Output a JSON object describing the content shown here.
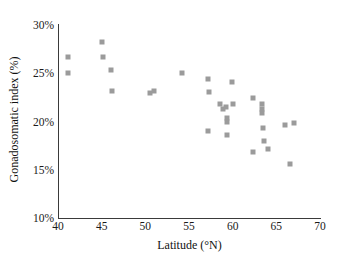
{
  "chart_data": {
    "type": "scatter",
    "title": "",
    "xlabel": "Latitude (°N)",
    "ylabel": "Gonadosomatic index (%)",
    "xlim": [
      40,
      70
    ],
    "ylim": [
      10,
      30
    ],
    "xticks": [
      40,
      45,
      50,
      55,
      60,
      65,
      70
    ],
    "xtick_labels": [
      "40",
      "45",
      "50",
      "55",
      "60",
      "65",
      "70"
    ],
    "yticks": [
      10,
      15,
      20,
      25,
      30
    ],
    "ytick_labels": [
      "10%",
      "15%",
      "20%",
      "25%",
      "30%"
    ],
    "grid": false,
    "legend": null,
    "marker_color": "#9b9b9b",
    "marker_shape": "square",
    "axis_color": "#3a3a3a",
    "series": [
      {
        "name": "Gonadosomatic index vs latitude",
        "points": [
          [
            41.2,
            26.7
          ],
          [
            41.2,
            25.0
          ],
          [
            45.0,
            28.2
          ],
          [
            45.2,
            26.7
          ],
          [
            46.1,
            25.3
          ],
          [
            46.2,
            23.2
          ],
          [
            50.5,
            23.0
          ],
          [
            51.0,
            23.2
          ],
          [
            54.2,
            25.0
          ],
          [
            57.2,
            24.4
          ],
          [
            57.3,
            23.1
          ],
          [
            57.2,
            19.0
          ],
          [
            58.5,
            21.8
          ],
          [
            58.9,
            21.3
          ],
          [
            59.2,
            21.5
          ],
          [
            59.3,
            20.4
          ],
          [
            59.3,
            20.0
          ],
          [
            59.4,
            18.6
          ],
          [
            59.9,
            24.1
          ],
          [
            60.0,
            21.8
          ],
          [
            62.3,
            22.4
          ],
          [
            62.3,
            16.8
          ],
          [
            63.4,
            21.8
          ],
          [
            63.4,
            21.3
          ],
          [
            63.4,
            20.9
          ],
          [
            63.5,
            19.3
          ],
          [
            63.6,
            18.0
          ],
          [
            64.1,
            17.1
          ],
          [
            66.0,
            19.6
          ],
          [
            66.6,
            15.6
          ],
          [
            67.0,
            19.8
          ]
        ]
      }
    ]
  }
}
